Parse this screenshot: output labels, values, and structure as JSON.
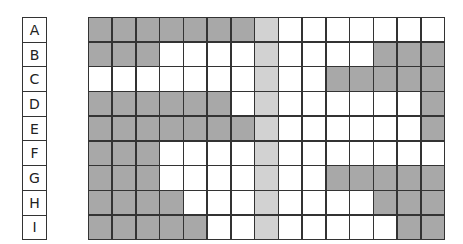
{
  "row_labels": [
    "A",
    "B",
    "C",
    "D",
    "E",
    "F",
    "G",
    "H",
    "I"
  ],
  "columns": 15,
  "colors": {
    "dark": "#a8a8a8",
    "light": "#d2d2d2",
    "empty": "#ffffff",
    "line": "#333333"
  },
  "legend": {
    "d": "dark gray filled",
    "l": "light gray highlighted column",
    "w": "white empty"
  },
  "grid": [
    [
      "d",
      "d",
      "d",
      "d",
      "d",
      "d",
      "d",
      "l",
      "w",
      "w",
      "w",
      "w",
      "w",
      "w",
      "w"
    ],
    [
      "d",
      "d",
      "d",
      "w",
      "w",
      "w",
      "w",
      "l",
      "w",
      "w",
      "w",
      "w",
      "d",
      "d",
      "d"
    ],
    [
      "w",
      "w",
      "w",
      "w",
      "w",
      "w",
      "w",
      "l",
      "w",
      "w",
      "d",
      "d",
      "d",
      "d",
      "d"
    ],
    [
      "d",
      "d",
      "d",
      "d",
      "d",
      "d",
      "w",
      "l",
      "w",
      "w",
      "w",
      "w",
      "w",
      "w",
      "d"
    ],
    [
      "d",
      "d",
      "d",
      "d",
      "d",
      "d",
      "d",
      "l",
      "w",
      "w",
      "w",
      "w",
      "w",
      "w",
      "d"
    ],
    [
      "d",
      "d",
      "d",
      "w",
      "w",
      "w",
      "w",
      "l",
      "w",
      "w",
      "w",
      "w",
      "w",
      "w",
      "w"
    ],
    [
      "d",
      "d",
      "d",
      "w",
      "w",
      "w",
      "w",
      "l",
      "w",
      "w",
      "d",
      "d",
      "d",
      "d",
      "d"
    ],
    [
      "d",
      "d",
      "d",
      "d",
      "w",
      "w",
      "w",
      "l",
      "w",
      "w",
      "w",
      "w",
      "d",
      "d",
      "d"
    ],
    [
      "d",
      "d",
      "d",
      "d",
      "d",
      "w",
      "w",
      "l",
      "w",
      "w",
      "w",
      "w",
      "w",
      "d",
      "d"
    ]
  ]
}
